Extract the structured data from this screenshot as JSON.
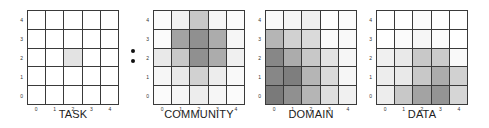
{
  "figure": {
    "separator_bullets": 2,
    "axis_ticks": [
      "0",
      "1",
      "2",
      "3",
      "4"
    ],
    "panels": [
      {
        "title": "TASK",
        "grid": [
          [
            0.0,
            0.0,
            0.0,
            0.0,
            0.0
          ],
          [
            0.0,
            0.0,
            0.0,
            0.0,
            0.0
          ],
          [
            0.0,
            0.0,
            0.15,
            0.0,
            0.0
          ],
          [
            0.0,
            0.0,
            0.0,
            0.0,
            0.0
          ],
          [
            0.0,
            0.0,
            0.0,
            0.0,
            0.0
          ]
        ]
      },
      {
        "title": "COMMUNITY",
        "grid": [
          [
            0.02,
            0.08,
            0.3,
            0.05,
            0.02
          ],
          [
            0.02,
            0.5,
            0.6,
            0.45,
            0.05
          ],
          [
            0.12,
            0.3,
            0.6,
            0.45,
            0.08
          ],
          [
            0.05,
            0.12,
            0.25,
            0.1,
            0.03
          ],
          [
            0.02,
            0.05,
            0.1,
            0.05,
            0.02
          ]
        ]
      },
      {
        "title": "DOMAIN",
        "grid": [
          [
            0.03,
            0.05,
            0.08,
            0.0,
            0.02
          ],
          [
            0.4,
            0.25,
            0.2,
            0.02,
            0.03
          ],
          [
            0.65,
            0.45,
            0.3,
            0.15,
            0.05
          ],
          [
            0.65,
            0.7,
            0.4,
            0.2,
            0.05
          ],
          [
            0.72,
            0.6,
            0.4,
            0.18,
            0.08
          ]
        ]
      },
      {
        "title": "DATA",
        "grid": [
          [
            0.0,
            0.0,
            0.02,
            0.0,
            0.0
          ],
          [
            0.0,
            0.02,
            0.05,
            0.02,
            0.0
          ],
          [
            0.08,
            0.12,
            0.3,
            0.28,
            0.03
          ],
          [
            0.1,
            0.12,
            0.3,
            0.45,
            0.25
          ],
          [
            0.1,
            0.3,
            0.5,
            0.58,
            0.22
          ]
        ]
      }
    ]
  },
  "chart_data": {
    "type": "heatmap",
    "title": "",
    "x_ticks": [
      "0",
      "1",
      "2",
      "3",
      "4"
    ],
    "y_ticks": [
      "0",
      "1",
      "2",
      "3",
      "4"
    ],
    "rows_order": "top row is y=4, bottom row is y=0",
    "value_scale": "0 = white, 1 = darkest gray",
    "panels": [
      {
        "label": "TASK",
        "values": [
          [
            0,
            0,
            0,
            0,
            0
          ],
          [
            0,
            0,
            0,
            0,
            0
          ],
          [
            0,
            0,
            0.15,
            0,
            0
          ],
          [
            0,
            0,
            0,
            0,
            0
          ],
          [
            0,
            0,
            0,
            0,
            0
          ]
        ]
      },
      {
        "label": "COMMUNITY",
        "values": [
          [
            0.02,
            0.08,
            0.3,
            0.05,
            0.02
          ],
          [
            0.02,
            0.5,
            0.6,
            0.45,
            0.05
          ],
          [
            0.12,
            0.3,
            0.6,
            0.45,
            0.08
          ],
          [
            0.05,
            0.12,
            0.25,
            0.1,
            0.03
          ],
          [
            0.02,
            0.05,
            0.1,
            0.05,
            0.02
          ]
        ]
      },
      {
        "label": "DOMAIN",
        "values": [
          [
            0.03,
            0.05,
            0.08,
            0.0,
            0.02
          ],
          [
            0.4,
            0.25,
            0.2,
            0.02,
            0.03
          ],
          [
            0.65,
            0.45,
            0.3,
            0.15,
            0.05
          ],
          [
            0.65,
            0.7,
            0.4,
            0.2,
            0.05
          ],
          [
            0.72,
            0.6,
            0.4,
            0.18,
            0.08
          ]
        ]
      },
      {
        "label": "DATA",
        "values": [
          [
            0,
            0,
            0.02,
            0,
            0
          ],
          [
            0,
            0.02,
            0.05,
            0.02,
            0
          ],
          [
            0.08,
            0.12,
            0.3,
            0.28,
            0.03
          ],
          [
            0.1,
            0.12,
            0.3,
            0.45,
            0.25
          ],
          [
            0.1,
            0.3,
            0.5,
            0.58,
            0.22
          ]
        ]
      }
    ]
  }
}
